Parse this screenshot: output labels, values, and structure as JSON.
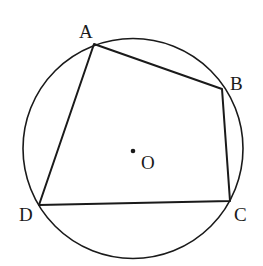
{
  "diagram": {
    "type": "cyclic-quadrilateral",
    "stroke_color": "#1a1a1a",
    "background": "#ffffff",
    "circle": {
      "name": "O",
      "cx": 133,
      "cy": 148.5,
      "r": 110
    },
    "center": {
      "label": "O",
      "x": 133,
      "y": 151,
      "label_x": 141,
      "label_y": 169
    },
    "vertices": [
      {
        "label": "A",
        "x": 94,
        "y": 44,
        "label_x": 79,
        "label_y": 38
      },
      {
        "label": "B",
        "x": 222,
        "y": 89,
        "label_x": 230,
        "label_y": 90
      },
      {
        "label": "C",
        "x": 230,
        "y": 201,
        "label_x": 234,
        "label_y": 221
      },
      {
        "label": "D",
        "x": 39,
        "y": 205,
        "label_x": 19,
        "label_y": 221
      }
    ],
    "edges": [
      "AB",
      "BC",
      "CD",
      "DA"
    ]
  }
}
